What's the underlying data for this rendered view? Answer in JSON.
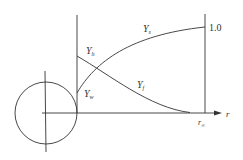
{
  "diagram": {
    "type": "profile-schematic",
    "colors": {
      "stroke": "#333333",
      "background": "#ffffff"
    },
    "labels": {
      "y_s": {
        "main": "Y",
        "sub": "s"
      },
      "y_h": {
        "main": "Y",
        "sub": "h"
      },
      "y_f": {
        "main": "Y",
        "sub": "f"
      },
      "y_w": {
        "main": "Y",
        "sub": "w"
      },
      "one": "1.0",
      "r_axis": "r",
      "r_inf": {
        "main": "r",
        "sub": "∞"
      }
    }
  }
}
